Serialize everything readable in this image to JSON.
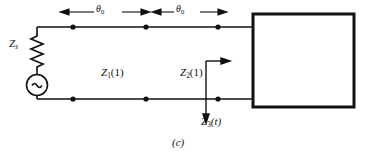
{
  "figure": {
    "caption": "(c)",
    "kind": "circuit-schematic"
  },
  "dimensions": {
    "left": {
      "symbol": "θ",
      "subscript": "0"
    },
    "right": {
      "symbol": "θ",
      "subscript": "0"
    }
  },
  "components": {
    "source_impedance": {
      "symbol": "Z",
      "subscript": "s"
    },
    "ac_source": {
      "glyph": "∼"
    },
    "load_box": {
      "label": ""
    }
  },
  "impedances": [
    {
      "symbol": "Z",
      "subscript": "1",
      "argument": "(1)"
    },
    {
      "symbol": "Z",
      "subscript": "2",
      "argument": "(1)"
    },
    {
      "symbol": "Z",
      "subscript": "3",
      "argument": "(t)"
    }
  ],
  "colors": {
    "line": "#111111",
    "text": "#111111",
    "background": "#ffffff"
  }
}
